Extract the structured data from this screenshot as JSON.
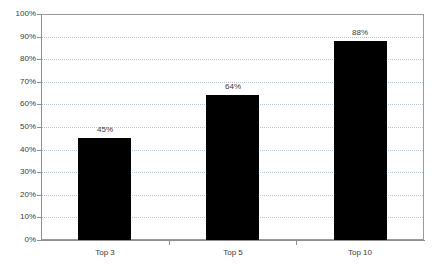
{
  "chart_data": {
    "type": "bar",
    "title": "",
    "subtitle": "",
    "xlabel": "",
    "ylabel": "",
    "categories": [
      "Top 3",
      "Top 5",
      "Top 10"
    ],
    "values": [
      45,
      64,
      88
    ],
    "value_labels": [
      "45%",
      "64%",
      "88%"
    ],
    "ylim": [
      0,
      100
    ],
    "ytick_values": [
      0,
      10,
      20,
      30,
      40,
      50,
      60,
      70,
      80,
      90,
      100
    ],
    "ytick_labels": [
      "0%",
      "10%",
      "20%",
      "30%",
      "40%",
      "50%",
      "60%",
      "70%",
      "80%",
      "90%",
      "100%"
    ],
    "grid": true,
    "grid_axis": "y",
    "grid_style": "dotted",
    "legend": false,
    "legend_position": "none",
    "bar_color": "#000000",
    "grid_color": "#b9c6d2",
    "axis_color": "#8f8f8f",
    "text_color": "#3a3a3a",
    "background_color": "#ffffff"
  }
}
